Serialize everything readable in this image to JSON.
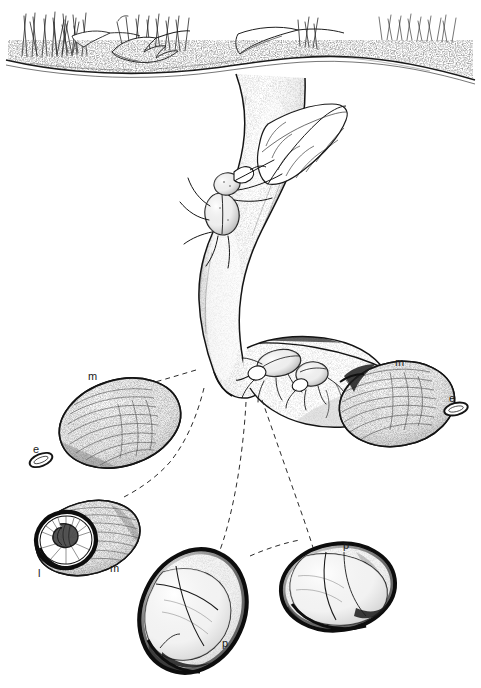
{
  "figure": {
    "medium": "pen-and-ink stipple line drawing",
    "background_color": "#ffffff",
    "ink_color": "#1a1a1a",
    "width": 481,
    "height": 688
  },
  "labels": [
    {
      "id": "m-left",
      "text": "m",
      "x": 88,
      "y": 371,
      "meaning": "brood mass"
    },
    {
      "id": "e-left",
      "text": "e",
      "x": 33,
      "y": 444,
      "meaning": "egg"
    },
    {
      "id": "l-larva",
      "text": "l",
      "x": 38,
      "y": 568,
      "meaning": "larva"
    },
    {
      "id": "m-larva",
      "text": "m",
      "x": 110,
      "y": 563,
      "meaning": "brood mass"
    },
    {
      "id": "m-right",
      "text": "m",
      "x": 395,
      "y": 357,
      "meaning": "brood mass"
    },
    {
      "id": "e-right",
      "text": "e",
      "x": 449,
      "y": 393,
      "meaning": "egg"
    },
    {
      "id": "p-lower",
      "text": "p",
      "x": 222,
      "y": 638,
      "meaning": "pupa"
    },
    {
      "id": "p-upper",
      "text": "p",
      "x": 343,
      "y": 540,
      "meaning": "pupa"
    }
  ],
  "scene": {
    "surface": {
      "name": "soil-surface",
      "description": "undulating stippled ground line across top of plate with tufts of grass stems and two broad fallen leaves"
    },
    "grass_tufts": 3,
    "fallen_leaves": 2,
    "burrow": {
      "name": "main-burrow-shaft",
      "description": "vertical tunnel descending from surface, bending left then down to a junction"
    },
    "beetles": [
      {
        "name": "beetle-with-leaf",
        "description": "adult beetle in upper burrow dragging a sectioned leaf downward"
      },
      {
        "name": "beetle-pair-chamber",
        "description": "two adult beetles facing each other in the lateral brood chamber"
      }
    ],
    "chambers": [
      {
        "name": "lateral-brood-chamber",
        "description": "horizontal chamber right of shaft containing beetle pair and packed plant material"
      }
    ]
  },
  "insets": [
    {
      "id": "inset-mass-left",
      "name": "brood-mass-inset-left",
      "description": "ovoid fibrous brood mass, stippled and striated"
    },
    {
      "id": "inset-egg-left",
      "name": "egg-inset-left",
      "description": "small outlined elliptical egg"
    },
    {
      "id": "inset-larva",
      "name": "larva-in-mass-inset",
      "description": "brood mass cut open end-on revealing coiled C-shaped larva in a dark-rimmed cavity"
    },
    {
      "id": "inset-mass-right",
      "name": "brood-mass-inset-right",
      "description": "ovoid fibrous brood mass at right attached to chamber"
    },
    {
      "id": "inset-egg-right",
      "name": "egg-inset-right",
      "description": "small outlined elliptical egg"
    },
    {
      "id": "inset-pupa-lower",
      "name": "pupa-inset-lower",
      "description": "pale pupa seen through a dark-walled opened cocoon, lower centre"
    },
    {
      "id": "inset-pupa-upper",
      "name": "pupa-inset-upper",
      "description": "pale pupa seen through a dark-walled opened cocoon, right"
    }
  ],
  "leader_lines": {
    "name": "dashed-leader-lines",
    "style": "dashed",
    "count": 5,
    "description": "curved dashed lines linking burrow junction and chamber to the detail insets below"
  }
}
